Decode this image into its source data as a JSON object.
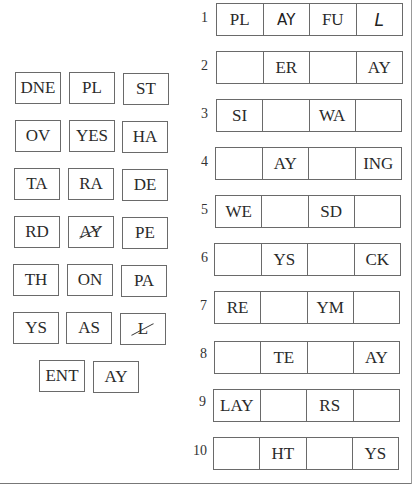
{
  "tiles": [
    {
      "text": "DNE",
      "used": false
    },
    {
      "text": "PL",
      "used": false
    },
    {
      "text": "ST",
      "used": false
    },
    {
      "text": "OV",
      "used": false
    },
    {
      "text": "YES",
      "used": false
    },
    {
      "text": "HA",
      "used": false
    },
    {
      "text": "TA",
      "used": false
    },
    {
      "text": "RA",
      "used": false
    },
    {
      "text": "DE",
      "used": false
    },
    {
      "text": "RD",
      "used": false
    },
    {
      "text": "AY",
      "used": true
    },
    {
      "text": "PE",
      "used": false
    },
    {
      "text": "TH",
      "used": false
    },
    {
      "text": "ON",
      "used": false
    },
    {
      "text": "PA",
      "used": false
    },
    {
      "text": "YS",
      "used": false
    },
    {
      "text": "AS",
      "used": false
    },
    {
      "text": "L",
      "used": true
    },
    {
      "text": "ENT",
      "used": false
    },
    {
      "text": "AY",
      "used": false
    }
  ],
  "rows": [
    {
      "num": "1",
      "cells": [
        "PL",
        "AY",
        "FU",
        "L"
      ]
    },
    {
      "num": "2",
      "cells": [
        "",
        "ER",
        "",
        "AY"
      ]
    },
    {
      "num": "3",
      "cells": [
        "SI",
        "",
        "WA",
        ""
      ]
    },
    {
      "num": "4",
      "cells": [
        "",
        "AY",
        "",
        "ING"
      ]
    },
    {
      "num": "5",
      "cells": [
        "WE",
        "",
        "SD",
        ""
      ]
    },
    {
      "num": "6",
      "cells": [
        "",
        "YS",
        "",
        "CK"
      ]
    },
    {
      "num": "7",
      "cells": [
        "RE",
        "",
        "YM",
        ""
      ]
    },
    {
      "num": "8",
      "cells": [
        "",
        "TE",
        "",
        "AY"
      ]
    },
    {
      "num": "9",
      "cells": [
        "LAY",
        "",
        "RS",
        ""
      ]
    },
    {
      "num": "10",
      "cells": [
        "",
        "HT",
        "",
        "YS"
      ]
    }
  ],
  "handwritten": {
    "row": 0,
    "cells": [
      1,
      3
    ]
  }
}
